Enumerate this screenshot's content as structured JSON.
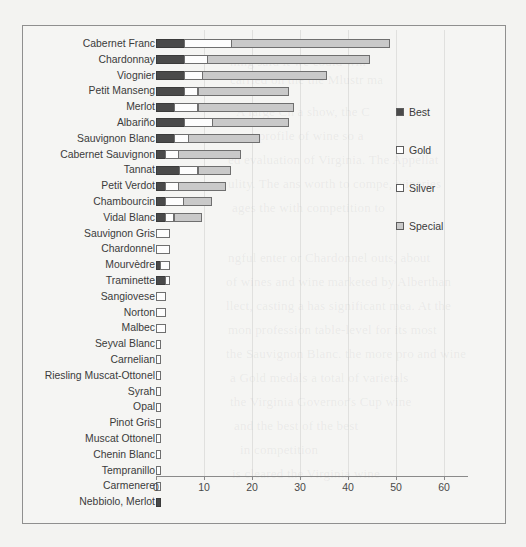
{
  "chart_data": {
    "type": "bar",
    "orientation": "horizontal",
    "stacked": true,
    "title": "",
    "xlabel": "",
    "ylabel": "",
    "xlim": [
      0,
      65
    ],
    "xticks": [
      0,
      10,
      20,
      30,
      40,
      50,
      60
    ],
    "xticklabels": [
      "0",
      "10",
      "20",
      "30",
      "40",
      "50",
      "60"
    ],
    "grid": false,
    "legend_position": "right",
    "categories": [
      "Cabernet Franc",
      "Chardonnay",
      "Viognier",
      "Petit Manseng",
      "Merlot",
      "Albariño",
      "Sauvignon Blanc",
      "Cabernet Sauvignon",
      "Tannat",
      "Petit Verdot",
      "Chambourcin",
      "Vidal Blanc",
      "Sauvignon Gris",
      "Chardonnel",
      "Mourvèdre",
      "Traminette",
      "Sangiovese",
      "Norton",
      "Malbec",
      "Seyval Blanc",
      "Carnelian",
      "Riesling Muscat-Ottonel",
      "Syrah",
      "Opal",
      "Pinot Gris",
      "Muscat Ottonel",
      "Chenin Blanc",
      "Tempranillo",
      "Carmenere",
      "Nebbiolo, Merlot"
    ],
    "series": [
      {
        "name": "Best",
        "color": "#4a4a4a",
        "values": [
          6,
          6,
          6,
          6,
          4,
          6,
          4,
          2,
          5,
          2,
          2,
          2,
          0,
          0,
          1,
          2,
          0,
          0,
          0,
          0,
          0,
          0,
          0,
          0,
          0,
          0,
          0,
          0,
          0,
          1
        ]
      },
      {
        "name": "Gold",
        "color": "#ffffff",
        "values": [
          10,
          5,
          4,
          3,
          5,
          6,
          3,
          3,
          4,
          3,
          4,
          2,
          3,
          3,
          2,
          1,
          2,
          2,
          2,
          1,
          1,
          1,
          1,
          1,
          1,
          1,
          1,
          1,
          1,
          0
        ]
      },
      {
        "name": "Silver",
        "color": "#f4f4f4",
        "values": [
          0,
          0,
          0,
          0,
          0,
          0,
          0,
          0,
          0,
          0,
          0,
          0,
          0,
          0,
          0,
          0,
          0,
          0,
          0,
          0,
          0,
          0,
          0,
          0,
          0,
          0,
          0,
          0,
          0,
          0
        ]
      },
      {
        "name": "Special",
        "color": "#c9c9c9",
        "values": [
          33,
          34,
          26,
          19,
          20,
          16,
          15,
          13,
          7,
          10,
          6,
          6,
          0,
          0,
          0,
          0,
          0,
          0,
          0,
          0,
          0,
          0,
          0,
          0,
          0,
          0,
          0,
          0,
          0,
          0
        ]
      }
    ],
    "totals": [
      49,
      45,
      36,
      28,
      29,
      28,
      22,
      18,
      16,
      15,
      12,
      10,
      3,
      3,
      3,
      3,
      2,
      2,
      2,
      1,
      1,
      1,
      1,
      1,
      1,
      1,
      1,
      1,
      1,
      1
    ]
  },
  "legend": {
    "items": [
      {
        "label": "Best",
        "swatch": "sw-best"
      },
      {
        "label": "Gold",
        "swatch": "sw-gold"
      },
      {
        "label": "Silver",
        "swatch": "sw-silver"
      },
      {
        "label": "Special",
        "swatch": "sw-special"
      }
    ]
  },
  "page_bleed": [
    {
      "text": "Bure Amount",
      "x": 238,
      "y": 36,
      "size": 13
    },
    {
      "text": "ning said it we could win",
      "x": 230,
      "y": 54,
      "size": 13
    },
    {
      "text": "carried on the the Mlustr ma",
      "x": 230,
      "y": 72,
      "size": 13
    },
    {
      "text": "A large Cn a show, the C",
      "x": 236,
      "y": 104,
      "size": 13
    },
    {
      "text": "nent profile of wine so a",
      "x": 232,
      "y": 128,
      "size": 13
    },
    {
      "text": "ed evaluation of Virginia. The Appellat",
      "x": 228,
      "y": 152,
      "size": 13
    },
    {
      "text": "ulity. The ans worth to compe, wineries",
      "x": 228,
      "y": 176,
      "size": 13
    },
    {
      "text": "ages the with competition to",
      "x": 232,
      "y": 200,
      "size": 13
    },
    {
      "text": "ngful enter or Chardonnel outs, about",
      "x": 228,
      "y": 250,
      "size": 13
    },
    {
      "text": "of wines and wine marketed by Alberthan",
      "x": 226,
      "y": 274,
      "size": 13
    },
    {
      "text": "llect, casting a has significant mea. At the",
      "x": 226,
      "y": 298,
      "size": 13
    },
    {
      "text": "mon profession table-level for its most",
      "x": 228,
      "y": 322,
      "size": 13
    },
    {
      "text": "the Sauvignon Blanc. the more pro and wine",
      "x": 226,
      "y": 346,
      "size": 13
    },
    {
      "text": "a Gold medals a total of varietals",
      "x": 230,
      "y": 370,
      "size": 13
    },
    {
      "text": "the Virginia Governor's Cup wine",
      "x": 230,
      "y": 394,
      "size": 13
    },
    {
      "text": "and the best of the best",
      "x": 234,
      "y": 418,
      "size": 13
    },
    {
      "text": "in competition",
      "x": 240,
      "y": 442,
      "size": 13
    },
    {
      "text": "is cleared the Virginia wine",
      "x": 232,
      "y": 466,
      "size": 13
    }
  ]
}
